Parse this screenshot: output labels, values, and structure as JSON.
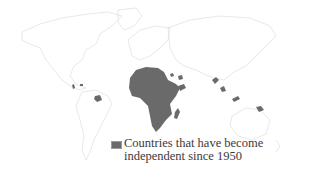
{
  "map": {
    "type": "world-outline",
    "outline_color": "#d6d6d6",
    "highlight_color": "#6a6a6a",
    "highlighted_regions": [
      "Africa",
      "Madagascar",
      "Caribbean islands",
      "Guyana region",
      "Arabian peninsula / Yemen region",
      "South Asia (Bangladesh region)",
      "Southeast Asia (Malaysia / Indonesia)",
      "Papua New Guinea"
    ]
  },
  "legend": {
    "swatch_color": "#6a6a6a",
    "line1": "Countries that have become",
    "line2": "independent since 1950"
  }
}
